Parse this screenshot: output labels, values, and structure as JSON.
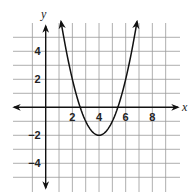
{
  "chart_data": {
    "type": "line",
    "title": "",
    "xlabel": "x",
    "ylabel": "y",
    "xlim": [
      -2,
      9
    ],
    "ylim": [
      -6,
      6
    ],
    "grid": true,
    "x_ticks": [
      2,
      4,
      6,
      8
    ],
    "y_ticks": [
      4,
      2,
      -2,
      -4
    ],
    "tick_labels": {
      "x": [
        "2",
        "4",
        "6",
        "8"
      ],
      "y": [
        "4",
        "2",
        "−2",
        "−4"
      ]
    },
    "series": [
      {
        "name": "parabola",
        "vertex": [
          4,
          -2
        ],
        "x_intercepts": [
          2.59,
          5.41
        ],
        "x": [
          1.15,
          2,
          3,
          4,
          5,
          6,
          6.85
        ],
        "y": [
          6.1,
          2,
          -1,
          -2,
          -1,
          2,
          6.1
        ],
        "arrows_at_ends": true
      }
    ]
  },
  "labels": {
    "x_axis": "x",
    "y_axis": "y"
  }
}
